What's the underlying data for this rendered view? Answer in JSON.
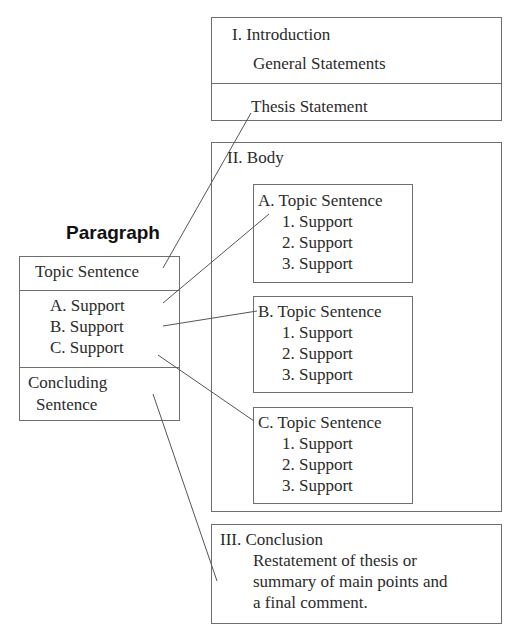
{
  "paragraph": {
    "title": "Paragraph",
    "topic_sentence": "Topic Sentence",
    "supports": [
      "A.  Support",
      "B.  Support",
      "C.  Support"
    ],
    "concluding": [
      "Concluding",
      "Sentence"
    ]
  },
  "essay": {
    "introduction": {
      "heading": "I.  Introduction",
      "general": "General Statements",
      "thesis": "Thesis Statement"
    },
    "body": {
      "heading": "II.  Body",
      "sections": [
        {
          "topic": "A.  Topic Sentence",
          "supports": [
            "1.  Support",
            "2.  Support",
            "3.  Support"
          ]
        },
        {
          "topic": "B.  Topic Sentence",
          "supports": [
            "1.  Support",
            "2.  Support",
            "3.  Support"
          ]
        },
        {
          "topic": "C.  Topic Sentence",
          "supports": [
            "1.  Support",
            "2.  Support",
            "3.  Support"
          ]
        }
      ]
    },
    "conclusion": {
      "heading": "III.  Conclusion",
      "lines": [
        "Restatement of thesis or",
        "summary of main points and",
        "a final comment."
      ]
    }
  },
  "connectors": [
    {
      "from": "paragraph-topic-sentence",
      "to": "thesis-statement"
    },
    {
      "from": "support-a",
      "to": "body-topic-a"
    },
    {
      "from": "support-b",
      "to": "body-topic-b"
    },
    {
      "from": "support-c",
      "to": "body-topic-c"
    },
    {
      "from": "concluding-sentence",
      "to": "conclusion"
    }
  ]
}
